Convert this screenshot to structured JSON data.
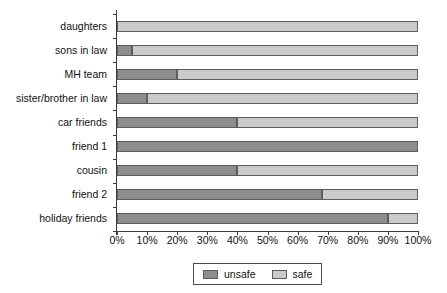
{
  "chart_data": {
    "type": "bar",
    "orientation": "horizontal",
    "stacked": true,
    "normalized": true,
    "title": "",
    "subtitle": "",
    "xlabel": "",
    "ylabel": "",
    "xlim": [
      0,
      100
    ],
    "grid": false,
    "legend_position": "bottom",
    "categories": [
      "daughters",
      "sons in law",
      "MH team",
      "sister/brother in law",
      "car friends",
      "friend 1",
      "cousin",
      "friend 2",
      "holiday friends"
    ],
    "series": [
      {
        "name": "unsafe",
        "color": "#8d8d8d",
        "values": [
          0,
          5,
          20,
          10,
          40,
          100,
          40,
          68,
          90
        ]
      },
      {
        "name": "safe",
        "color": "#cbcbcb",
        "values": [
          100,
          95,
          80,
          90,
          60,
          0,
          60,
          32,
          10
        ]
      }
    ],
    "x_ticks": [
      0,
      10,
      20,
      30,
      40,
      50,
      60,
      70,
      80,
      90,
      100
    ],
    "x_tick_labels": [
      "0%",
      "10%",
      "20%",
      "30%",
      "40%",
      "50%",
      "60%",
      "70%",
      "80%",
      "90%",
      "100%"
    ],
    "legend": [
      {
        "label": "unsafe",
        "color": "#8d8d8d"
      },
      {
        "label": "safe",
        "color": "#cbcbcb"
      }
    ]
  }
}
